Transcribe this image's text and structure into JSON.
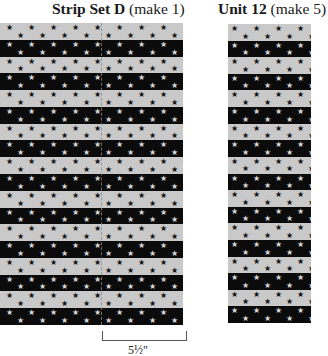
{
  "strip_set": {
    "title_bold": "Strip Set D",
    "title_rest": " (make 1)",
    "stripe_count": 18,
    "first_stripe": "light",
    "measurement_label": "5½\""
  },
  "unit": {
    "title_bold": "Unit 12",
    "title_rest": " (make 5)",
    "stripe_count": 18,
    "first_stripe": "light"
  },
  "fabric": {
    "light_color": "#c9c9c9",
    "dark_color": "#0b0b0b",
    "star_glyph": "★"
  }
}
